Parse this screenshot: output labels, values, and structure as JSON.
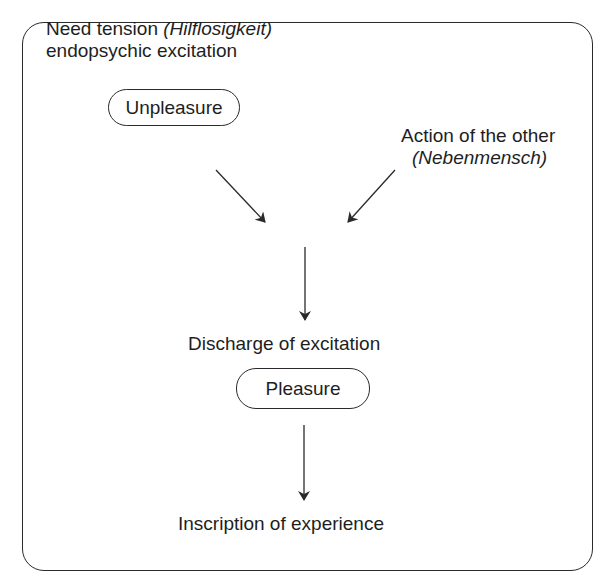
{
  "diagram": {
    "nodes": {
      "need": {
        "line1_plain": "Need tension ",
        "line1_italic": "(Hilflosigkeit)",
        "line2": "endopsychic excitation"
      },
      "unpleasure": {
        "label": "Unpleasure"
      },
      "other": {
        "line1": "Action of the other",
        "line2_italic": "(Nebenmensch)"
      },
      "discharge": {
        "label": "Discharge of excitation"
      },
      "pleasure": {
        "label": "Pleasure"
      },
      "inscription": {
        "label": "Inscription of experience"
      }
    },
    "edges": [
      {
        "from": "unpleasure",
        "to": "discharge"
      },
      {
        "from": "other",
        "to": "discharge"
      },
      {
        "from": "convergence",
        "to": "discharge"
      },
      {
        "from": "pleasure",
        "to": "inscription"
      }
    ],
    "colors": {
      "stroke": "#2a2a2a",
      "text": "#1e1e1e",
      "background": "#ffffff"
    }
  }
}
